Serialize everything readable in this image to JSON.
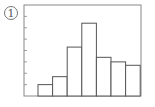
{
  "figure_label": "1",
  "chart_data": {
    "type": "bar",
    "subtype": "histogram",
    "title": "",
    "xlabel": "",
    "ylabel": "",
    "categories": [
      "bin1",
      "bin2",
      "bin3",
      "bin4",
      "bin5",
      "bin6",
      "bin7"
    ],
    "values": [
      1.0,
      1.7,
      4.3,
      6.4,
      3.4,
      3.0,
      2.7
    ],
    "ylim": [
      0,
      8
    ],
    "y_ticks": [
      1,
      2,
      3,
      4,
      5,
      6,
      7
    ],
    "y_tick_labels_shown": false,
    "x_tick_labels_shown": false,
    "grid": false,
    "legend": null,
    "bar_fill": "#ffffff",
    "bar_stroke": "#555555",
    "frame_color": "#888888"
  }
}
